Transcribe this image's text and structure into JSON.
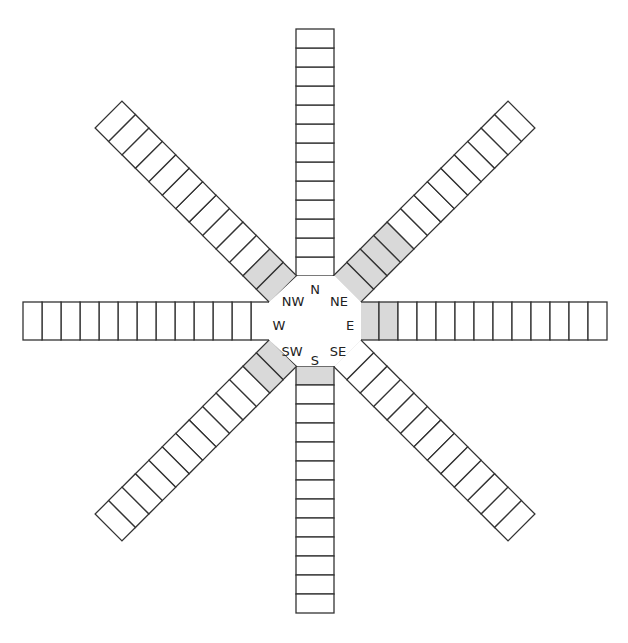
{
  "diagram": {
    "title": "",
    "center_labels": [
      {
        "id": "N",
        "text": "N",
        "x": 315,
        "y": 290
      },
      {
        "id": "NE",
        "text": "NE",
        "x": 339,
        "y": 302
      },
      {
        "id": "E",
        "text": "E",
        "x": 350,
        "y": 326
      },
      {
        "id": "SE",
        "text": "SE",
        "x": 338,
        "y": 352
      },
      {
        "id": "S",
        "text": "S",
        "x": 315,
        "y": 361
      },
      {
        "id": "SW",
        "text": "SW",
        "x": 292,
        "y": 352
      },
      {
        "id": "W",
        "text": "W",
        "x": 279,
        "y": 326
      },
      {
        "id": "NW",
        "text": "NW",
        "x": 293,
        "y": 302
      }
    ],
    "colors": {
      "shaded": "#d9d9d9",
      "empty": "#ffffff",
      "stroke": "#333333"
    },
    "arms": [
      {
        "direction": "N",
        "angle_deg": -90,
        "cells": 13,
        "shaded": 0
      },
      {
        "direction": "NE",
        "angle_deg": -45,
        "cells": 13,
        "shaded": 4
      },
      {
        "direction": "E",
        "angle_deg": 0,
        "cells": 13,
        "shaded": 2
      },
      {
        "direction": "SE",
        "angle_deg": 45,
        "cells": 13,
        "shaded": 0
      },
      {
        "direction": "S",
        "angle_deg": 90,
        "cells": 13,
        "shaded": 1
      },
      {
        "direction": "SW",
        "angle_deg": 135,
        "cells": 13,
        "shaded": 2
      },
      {
        "direction": "W",
        "angle_deg": 180,
        "cells": 13,
        "shaded": 0
      },
      {
        "direction": "NW",
        "angle_deg": -135,
        "cells": 13,
        "shaded": 2
      }
    ]
  }
}
